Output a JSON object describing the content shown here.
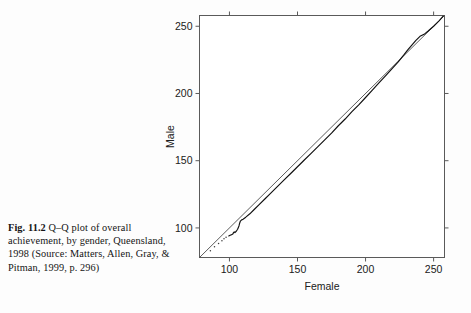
{
  "figure": {
    "label": "Fig. 11.2",
    "caption": "Q–Q plot of overall achievement, by gender, Queensland, 1998 (Source: Matters, Allen, Gray, & Pitman, 1999, p. 296)"
  },
  "colors": {
    "page_background": "#fdfdfd",
    "plot_background": "#ffffff",
    "frame": "#5a5a5a",
    "reference_line": "#4a4a4a",
    "data_curve": "#101010",
    "text": "#141414"
  },
  "chart_data": {
    "type": "line",
    "title": "",
    "xlabel": "Female",
    "ylabel": "Male",
    "xlim": [
      78,
      258
    ],
    "ylim": [
      78,
      258
    ],
    "xticks": [
      100,
      150,
      200,
      250
    ],
    "yticks": [
      100,
      150,
      200,
      250
    ],
    "xtick_labels": [
      "100",
      "150",
      "200",
      "250"
    ],
    "ytick_labels": [
      "100",
      "150",
      "200",
      "250"
    ],
    "grid": false,
    "legend": null,
    "ticks_on_all_sides": true,
    "series": [
      {
        "name": "Reference line (y = x)",
        "style": "solid-thin",
        "x": [
          78,
          258
        ],
        "y": [
          78,
          258
        ]
      },
      {
        "name": "Q-Q quantile curve",
        "style": "solid",
        "x": [
          99.5,
          100.5,
          101.5,
          102.5,
          103.0,
          103.5,
          104.0,
          105.0,
          106.0,
          107.0,
          107.5,
          108.0,
          109.0,
          110.0,
          112.0,
          115.0,
          118.0,
          122.0,
          126.0,
          130.0,
          135.0,
          140.0,
          145.0,
          150.0,
          155.0,
          160.0,
          165.0,
          170.0,
          175.0,
          180.0,
          185.0,
          190.0,
          195.0,
          200.0,
          205.0,
          210.0,
          215.0,
          220.0,
          224.0,
          228.0,
          231.0,
          234.0,
          237.0,
          240.0,
          243.0,
          246.0,
          250.0,
          254.0,
          257.0
        ],
        "y": [
          94.0,
          94.5,
          95.0,
          95.5,
          96.5,
          97.0,
          96.5,
          97.5,
          99.0,
          101.5,
          103.5,
          105.0,
          106.0,
          106.5,
          108.0,
          110.5,
          113.5,
          117.5,
          121.5,
          125.5,
          130.5,
          135.5,
          140.5,
          145.5,
          150.5,
          155.5,
          160.5,
          165.5,
          170.5,
          176.0,
          181.0,
          186.5,
          191.5,
          197.0,
          202.5,
          208.0,
          213.5,
          219.0,
          223.5,
          228.5,
          232.5,
          236.0,
          239.5,
          242.5,
          244.0,
          246.5,
          250.0,
          254.0,
          257.5
        ]
      },
      {
        "name": "Lower-tail sparse points",
        "style": "points",
        "x": [
          86.0,
          89.0,
          92.0,
          94.5,
          96.0,
          97.5
        ],
        "y": [
          83.0,
          86.0,
          88.5,
          90.5,
          92.0,
          93.0
        ]
      }
    ]
  }
}
